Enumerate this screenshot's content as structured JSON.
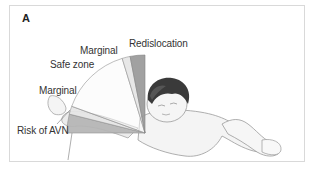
{
  "figure": {
    "panel_letter": "A",
    "labels": {
      "redislocation": "Redislocation",
      "marginal_upper": "Marginal",
      "safe_zone": "Safe zone",
      "marginal_lower": "Marginal",
      "risk_avn": "Risk of AVN"
    },
    "zones": [
      {
        "name": "Redislocation",
        "color": "#9a9a9a"
      },
      {
        "name": "Marginal",
        "color": "#e6e6e6"
      },
      {
        "name": "Safe zone",
        "color": "#fafafa"
      },
      {
        "name": "Marginal",
        "color": "#e6e6e6"
      },
      {
        "name": "Risk of AVN",
        "color": "#b5b5b5"
      }
    ]
  }
}
